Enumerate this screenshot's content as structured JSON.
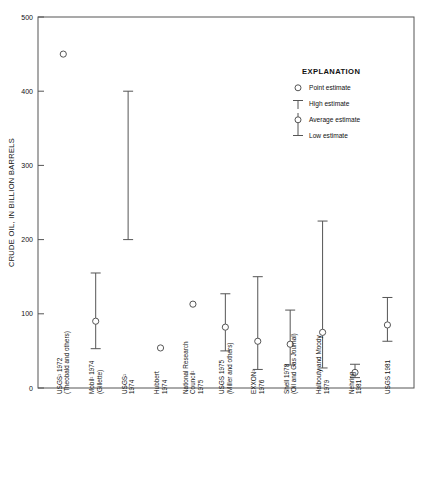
{
  "chart_data": {
    "type": "scatter",
    "title": "",
    "xlabel": "",
    "ylabel": "CRUDE OIL, IN BILLION BARRELS",
    "ylim": [
      0,
      500
    ],
    "yticks": [
      0,
      100,
      200,
      300,
      400,
      500
    ],
    "yticklabels": [
      "0",
      "100",
      "200",
      "300",
      "400",
      "500"
    ],
    "grid": false,
    "legend_position": "upper-right",
    "categories": [
      "USGS¹ 1972 (Theobald and others)",
      "Mobil¹ 1974 (Gillette)",
      "USGS¹ 1974",
      "Hubbert 1974",
      "National Research Council¹ 1975",
      "USGS 1975 (Miller and others)",
      "EXXON¹ 1976",
      "Shell 1978 (Oil and Gas Journal)",
      "Halbouty and Moody 1979",
      "Nehring 1981",
      "USGS 1981"
    ],
    "series": [
      {
        "name": "USGS¹ 1972 (Theobald and others)",
        "label_lines": [
          "USGS¹ 1972",
          "(Theobald and others)"
        ],
        "estimate_type": "point",
        "point": 450,
        "high": null,
        "average": null,
        "low": null
      },
      {
        "name": "Mobil¹ 1974 (Gillette)",
        "label_lines": [
          "Mobil¹ 1974",
          "(Gillette)"
        ],
        "estimate_type": "range",
        "point": null,
        "high": 155,
        "average": 90,
        "low": 53
      },
      {
        "name": "USGS¹ 1974",
        "label_lines": [
          "USGS¹",
          "1974"
        ],
        "estimate_type": "range-no-average",
        "point": null,
        "high": 400,
        "average": null,
        "low": 200
      },
      {
        "name": "Hubbert 1974",
        "label_lines": [
          "Hubbert",
          "1974"
        ],
        "estimate_type": "point",
        "point": 54,
        "high": null,
        "average": null,
        "low": null
      },
      {
        "name": "National Research Council¹ 1975",
        "label_lines": [
          "National Research",
          "Council¹",
          "1975"
        ],
        "estimate_type": "point",
        "point": 113,
        "high": null,
        "average": null,
        "low": null
      },
      {
        "name": "USGS 1975 (Miller and others)",
        "label_lines": [
          "USGS 1975",
          "(Miller and others)"
        ],
        "estimate_type": "range",
        "point": null,
        "high": 127,
        "average": 82,
        "low": 50
      },
      {
        "name": "EXXON¹ 1976",
        "label_lines": [
          "EXXON¹",
          "1976"
        ],
        "estimate_type": "range",
        "point": null,
        "high": 150,
        "average": 63,
        "low": 25
      },
      {
        "name": "Shell 1978 (Oil and Gas Journal)",
        "label_lines": [
          "Shell 1978",
          "(Oil and Gas Journal)"
        ],
        "estimate_type": "range",
        "point": null,
        "high": 105,
        "average": 59,
        "low": 31
      },
      {
        "name": "Halbouty and Moody 1979",
        "label_lines": [
          "Halbouty and Moody",
          "1979"
        ],
        "estimate_type": "range",
        "point": null,
        "high": 225,
        "average": 75,
        "low": 27
      },
      {
        "name": "Nehring 1981",
        "label_lines": [
          "Nehring",
          "1981"
        ],
        "estimate_type": "range",
        "point": null,
        "high": 32,
        "average": 21,
        "low": 14
      },
      {
        "name": "USGS 1981",
        "label_lines": [
          "USGS 1981"
        ],
        "estimate_type": "range",
        "point": null,
        "high": 122,
        "average": 85,
        "low": 63
      }
    ],
    "legend": {
      "title": "EXPLANATION",
      "entries": [
        {
          "key": "point-estimate",
          "label": "Point estimate",
          "glyph": "circle"
        },
        {
          "key": "high-estimate",
          "label": "High estimate",
          "glyph": "top-cap"
        },
        {
          "key": "average-estimate",
          "label": "Average estimate",
          "glyph": "circle-on-line"
        },
        {
          "key": "low-estimate",
          "label": "Low estimate",
          "glyph": "bottom-cap"
        }
      ]
    },
    "colors": {
      "axis": "#555555",
      "marker_stroke": "#555555",
      "marker_fill": "#ffffff",
      "text": "#111111",
      "background": "#ffffff"
    }
  }
}
